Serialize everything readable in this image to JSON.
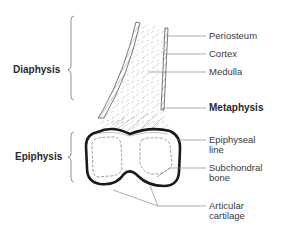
{
  "regions": {
    "diaphysis": "Diaphysis",
    "epiphysis": "Epiphysis"
  },
  "labels": {
    "periosteum": "Periosteum",
    "cortex": "Cortex",
    "medulla": "Medulla",
    "metaphysis": "Metaphysis",
    "epiphyseal_line_1": "Epiphyseal",
    "epiphyseal_line_2": "line",
    "subchondral_1": "Subchondral",
    "subchondral_2": "bone",
    "articular_1": "Articular",
    "articular_2": "cartilage"
  },
  "colors": {
    "outline": "#1a1a1a",
    "thin_line": "#6a6a6a",
    "leader": "#8a8a8a",
    "hatch": "#9a9a9a",
    "text": "#3a3a3a"
  }
}
